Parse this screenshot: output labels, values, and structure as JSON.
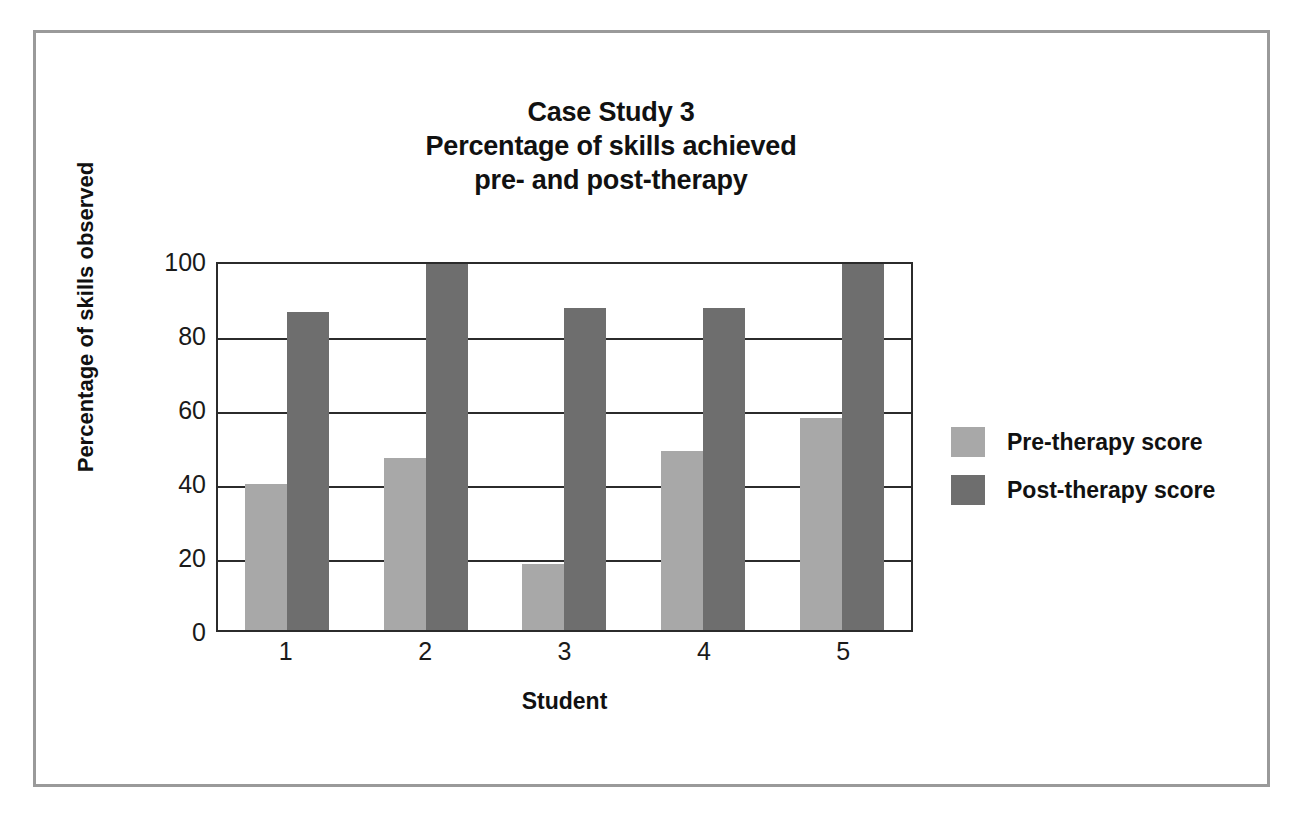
{
  "chart_data": {
    "type": "bar",
    "title": "Case Study 3\nPercentage of skills achieved\npre- and post-therapy",
    "title_lines": [
      "Case Study 3",
      "Percentage of skills achieved",
      "pre- and post-therapy"
    ],
    "xlabel": "Student",
    "ylabel": "Percentage of skills observed",
    "categories": [
      "1",
      "2",
      "3",
      "4",
      "5"
    ],
    "series": [
      {
        "name": "Pre-therapy score",
        "color": "#a8a8a8",
        "values": [
          40,
          47,
          18,
          49,
          58
        ]
      },
      {
        "name": "Post-therapy score",
        "color": "#6e6e6e",
        "values": [
          87,
          100,
          88,
          88,
          100
        ]
      }
    ],
    "ylim": [
      0,
      100
    ],
    "y_ticks": [
      0,
      20,
      40,
      60,
      80,
      100
    ],
    "y_tick_labels": [
      "0",
      "20",
      "40",
      "60",
      "80",
      "100"
    ],
    "grid": true,
    "grid_axis": "y",
    "legend_position": "right",
    "frame_color": "#9a9a9a",
    "axis_color": "#2b2b2b",
    "background": "#ffffff"
  }
}
